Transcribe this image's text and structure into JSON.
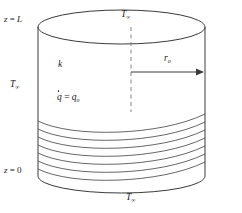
{
  "figure": {
    "kind": "heat-transfer-schematic",
    "width": 242,
    "height": 213,
    "background_color": "#ffffff",
    "line_color": "#3a3a3a",
    "text_color": "#1a1a1a"
  },
  "labels": {
    "z_top": {
      "var": "z",
      "eq": " = ",
      "value": "L"
    },
    "z_bottom": {
      "var": "z",
      "eq": " = ",
      "value": "0"
    },
    "t_top": {
      "symbol": "T",
      "subscript": "∞"
    },
    "t_left": {
      "symbol": "T",
      "subscript": "∞"
    },
    "t_bottom": {
      "symbol": "T",
      "subscript": "∞"
    },
    "conductivity": {
      "symbol": "k"
    },
    "generation": {
      "symbol": "q",
      "eq": " = ",
      "value": "q",
      "value_subscript": "o"
    },
    "radius": {
      "symbol": "r",
      "subscript": "o"
    }
  },
  "geometry": {
    "cylinder": {
      "left_x": 38,
      "right_x": 205,
      "top_ellipse_cy": 27,
      "bottom_arc_cy": 176,
      "ellipse_rx": 83.5,
      "ellipse_ry": 17
    },
    "centerline": {
      "x": 131,
      "y_top": 27,
      "y_bottom": 112,
      "style": "dashed"
    },
    "radius_arrow": {
      "x_start": 131,
      "x_end": 203,
      "y": 72,
      "direction": "right"
    },
    "coil": {
      "turn_count": 7,
      "y_start": 117,
      "y_end": 178
    }
  }
}
